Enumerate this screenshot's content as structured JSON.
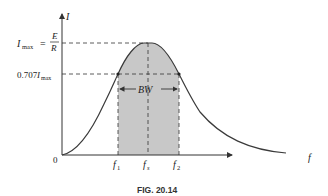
{
  "figure": {
    "caption": "FIG. 20.14",
    "y_axis_label": "I",
    "x_axis_label": "f",
    "origin_label": "0",
    "imax_label": "I",
    "imax_sub": "max",
    "imax_eq": "=",
    "imax_num": "E",
    "imax_den": "R",
    "level_coef": "0.707",
    "level_I": "I",
    "level_sub": "max",
    "bw_label": "BW",
    "f1": "f",
    "f1_sub": "1",
    "fs": "f",
    "fs_sub": "s",
    "f2": "f",
    "f2_sub": "2"
  },
  "colors": {
    "curve": "#3a3a3a",
    "shade": "#c8c8c8",
    "axis": "#333333"
  }
}
